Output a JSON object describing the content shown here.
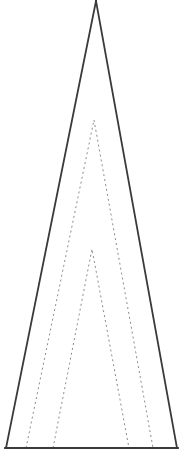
{
  "figure": {
    "canvas": {
      "width": 182,
      "height": 456,
      "background_color": "#ffffff"
    },
    "styles": {
      "solid_stroke_color": "#3a3a3a",
      "solid_stroke_width": 1.8,
      "dashed_stroke_color": "#8c8c8c",
      "dashed_stroke_width": 1.0,
      "dash_pattern": "2 3"
    },
    "baseline": {
      "label": "baseline",
      "y": 448,
      "x_start": 5,
      "x_end": 178
    }
  },
  "chart_data": {
    "type": "diagram",
    "xlabel": "",
    "ylabel": "",
    "xlim": [
      0,
      182
    ],
    "ylim": [
      0,
      456
    ],
    "grid": false,
    "legend": "none",
    "shapes": [
      {
        "name": "outer-triangle",
        "label": "Outer triangle",
        "style": "solid",
        "stroke": "#3a3a3a",
        "stroke_width": 1.8,
        "apex": [
          96,
          1
        ],
        "base_left": [
          6,
          448
        ],
        "base_right": [
          177,
          448
        ],
        "points": "96,1 6,448 177,448 96,1"
      },
      {
        "name": "inner-triangle-1",
        "label": "Inner dashed triangle (large)",
        "style": "dashed",
        "stroke": "#8c8c8c",
        "stroke_width": 1.0,
        "dash_pattern": "2 3",
        "apex": [
          94,
          120
        ],
        "base_left": [
          26,
          448
        ],
        "base_right": [
          153,
          448
        ],
        "points": "26,448 94,120 153,448"
      },
      {
        "name": "inner-triangle-2",
        "label": "Inner dashed triangle (small)",
        "style": "dashed",
        "stroke": "#8c8c8c",
        "stroke_width": 1.0,
        "dash_pattern": "2 3",
        "apex": [
          92,
          249
        ],
        "base_left": [
          53,
          448
        ],
        "base_right": [
          129,
          448
        ],
        "points": "53,448 92,249 129,448"
      }
    ]
  }
}
